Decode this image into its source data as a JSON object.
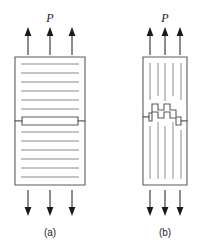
{
  "figure": {
    "title": "",
    "panels": [
      {
        "id": "a",
        "caption": "(a)",
        "load_label": "P",
        "fracture_type": "flat-transverse",
        "striation_orientation": "horizontal",
        "top_arrow_direction": "up",
        "bottom_arrow_direction": "down",
        "arrow_count_top": 3,
        "arrow_count_bottom": 3,
        "specimen": {
          "x": 15,
          "y": 57,
          "width": 70,
          "height": 128,
          "gap_y": 121,
          "notch_depth": 4,
          "notch_width": 7
        },
        "striation_count_top": 6,
        "striation_count_bottom": 6
      },
      {
        "id": "b",
        "caption": "(b)",
        "load_label": "P",
        "fracture_type": "jagged-stepped",
        "striation_orientation": "vertical",
        "top_arrow_direction": "up",
        "bottom_arrow_direction": "down",
        "arrow_count_top": 3,
        "arrow_count_bottom": 3,
        "specimen": {
          "x": 143,
          "y": 57,
          "width": 44,
          "height": 128,
          "gap_y": 121,
          "notch_depth": 4,
          "notch_width": 6
        },
        "striation_count_top": 5,
        "striation_count_bottom": 5,
        "step_profile": [
          0,
          0,
          -6,
          -6,
          -11,
          -11,
          -17,
          -17,
          -11,
          -11,
          -17,
          -17,
          -8,
          -8,
          0,
          0
        ]
      }
    ],
    "colors": {
      "outline": "#5a5a5a",
      "striation": "#8a8a8a",
      "arrow": "#1a1a1a",
      "text": "#1a1a1a",
      "background": "#ffffff"
    }
  }
}
